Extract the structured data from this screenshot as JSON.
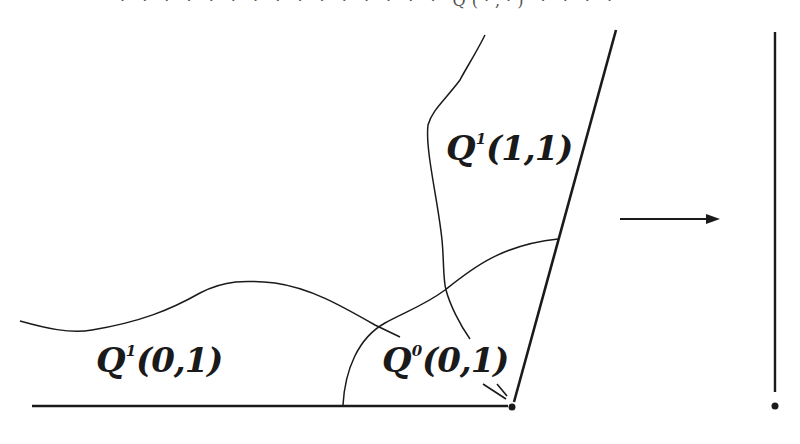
{
  "diagram": {
    "type": "region decomposition near a corner point with mapping arrow",
    "top_cutoff_text": "· · · · · · · · · · · · · · ·  Q(·,·)  · ·  · ·",
    "labels": [
      {
        "id": "q1-11",
        "base": "Q",
        "superscript": "1",
        "args": "(1,1)"
      },
      {
        "id": "q1-01",
        "base": "Q",
        "superscript": "1",
        "args": "(0,1)"
      },
      {
        "id": "q0-01",
        "base": "Q",
        "superscript": "0",
        "args": "(0,1)"
      }
    ],
    "elements": {
      "bottom_boundary": "horizontal line from (32,406) to (512,406)",
      "slanted_boundary": "line from corner (512,406) up to (616,30)",
      "corner_point": "dot at (512,406)",
      "wavy_curve": "curve from left edge across to near Q0(0,1)",
      "vertical_curve": "curve from top (485,35) down to near Q0(0,1)",
      "arc_curve": "arc from bottom line (342,406) up to slanted boundary (558,240)",
      "arrow": "horizontal arrow from (620,219) to (718,219)",
      "target_segment": "vertical line from (775,32) to (775,390) with dot at (775,406)"
    },
    "colors": {
      "stroke": "#1a1a1a",
      "background": "#ffffff"
    }
  }
}
